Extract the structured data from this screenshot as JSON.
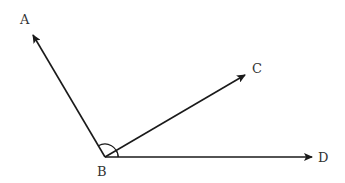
{
  "diagram": {
    "type": "geometry-angles",
    "vertex": {
      "label": "B",
      "x": 105,
      "y": 157
    },
    "points": [
      {
        "label": "A",
        "x": 33,
        "y": 35
      },
      {
        "label": "C",
        "x": 245,
        "y": 75
      },
      {
        "label": "D",
        "x": 312,
        "y": 157
      }
    ],
    "rays": [
      {
        "from": "B",
        "to": "A"
      },
      {
        "from": "B",
        "to": "C"
      },
      {
        "from": "B",
        "to": "D"
      }
    ],
    "angle_marks": [
      {
        "angle": "ABD",
        "description": "arc spanning from ray BA to ray BD"
      },
      {
        "angle": "CBD",
        "description": "small arc between ray BC and ray BD"
      }
    ],
    "colors": {
      "line": "#1a1a1a",
      "label": "#333333",
      "background": "#ffffff"
    }
  },
  "labels": {
    "A": "A",
    "B": "B",
    "C": "C",
    "D": "D"
  }
}
